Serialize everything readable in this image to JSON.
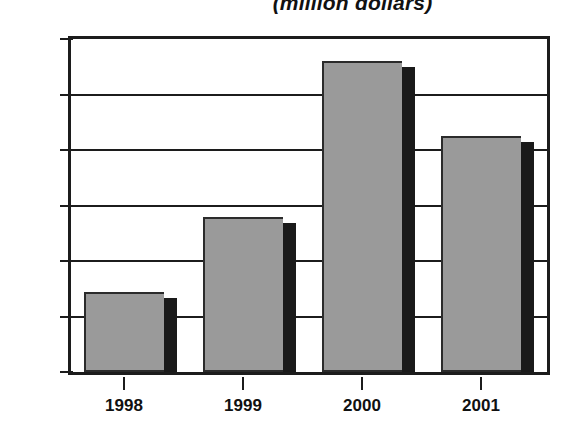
{
  "chart_data": {
    "type": "bar",
    "title": "(million dollars)",
    "xlabel": "",
    "ylabel": "",
    "categories": [
      "1998",
      "1999",
      "2000",
      "2001"
    ],
    "values": [
      3072,
      3140,
      3280,
      3213
    ],
    "ylim": [
      3000,
      3300
    ],
    "ytick_labels": [
      "3,300",
      "3,250",
      "3,200",
      "3,150",
      "3,100",
      "3,050",
      "3,000"
    ],
    "ytick_values": [
      3300,
      3250,
      3200,
      3150,
      3100,
      3050,
      3000
    ],
    "grid": true,
    "legend": null,
    "series": [
      {
        "name": "value",
        "values": [
          3072,
          3140,
          3280,
          3213
        ]
      }
    ],
    "colors": {
      "bar_fill": "#9a9a9a",
      "bar_shadow": "#1a1a1a",
      "bar_outline": "#2b2b2b",
      "axis": "#1c1c1c",
      "text": "#111111",
      "background": "#ffffff"
    }
  }
}
